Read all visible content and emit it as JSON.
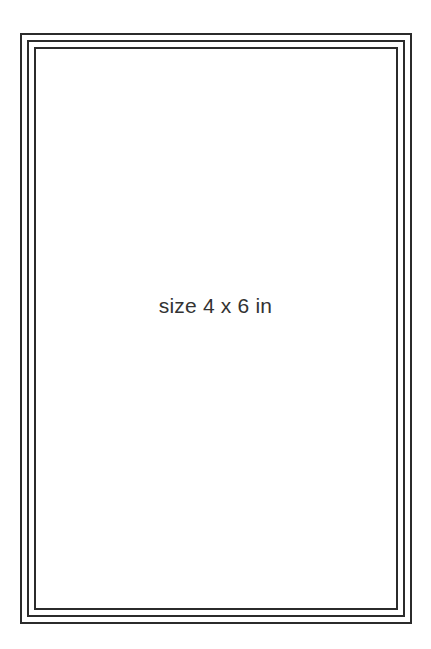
{
  "canvas": {
    "background": "#ffffff",
    "border_color": "#2b2b2b",
    "border_lines": 3
  },
  "label": {
    "text": "size 4 x 6 in",
    "color": "#333333"
  }
}
